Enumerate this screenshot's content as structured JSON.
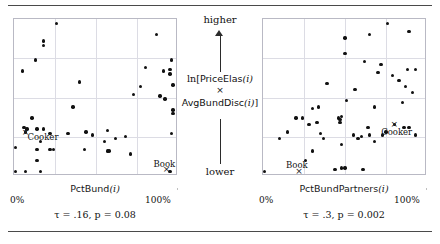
{
  "figure": {
    "y_axis": {
      "top_label": "higher",
      "bottom_label": "lower",
      "label_line1_prefix": "ln[",
      "label_line1_name": "PriceElas",
      "label_line1_arg": "(i)",
      "label_times": "×",
      "label_line2_name": "AvgBundDisc",
      "label_line2_arg": "(i)",
      "label_line2_suffix": "]",
      "label_plain": "ln[PriceElas(i) × AvgBundDisc(i)]"
    },
    "panels": [
      {
        "id": "left",
        "x_axis_name": "PctBund",
        "x_axis_arg": "(i)",
        "x_axis_label_plain": "PctBund(i)",
        "x_tick_min": "0%",
        "x_tick_max": "100%",
        "stat_text": "τ = .16, p = 0.08",
        "tau": ".16",
        "p_value": "0.08",
        "highlights": [
          {
            "label": "Cooker",
            "label_pos": "right"
          },
          {
            "label": "Book",
            "label_pos": "above"
          }
        ]
      },
      {
        "id": "right",
        "x_axis_name": "PctBundPartners",
        "x_axis_arg": "(i)",
        "x_axis_label_plain": "PctBundPartners(i)",
        "x_tick_min": "0%",
        "x_tick_max": "100%",
        "stat_text": "τ = .3, p = 0.002",
        "tau": ".3",
        "p_value": "0.002",
        "highlights": [
          {
            "label": "Cooker",
            "label_pos": "below"
          },
          {
            "label": "Book",
            "label_pos": "above"
          }
        ]
      }
    ],
    "colors": {
      "dot": "#111111",
      "grid": "#dcdce4",
      "frame": "#b9b9c4",
      "rule": "#4a4a4a",
      "text": "#111111"
    }
  },
  "chart_data": [
    {
      "type": "scatter",
      "panel": "left",
      "title": "",
      "xlabel": "PctBund(i)",
      "ylabel": "ln[PriceElas(i) × AvgBundDisc(i)]",
      "xlim": [
        0,
        100
      ],
      "ylim": [
        0,
        100
      ],
      "xtick_labels": [
        "0%",
        "100%"
      ],
      "ytick_labels": [
        "lower",
        "higher"
      ],
      "grid": true,
      "legend": "none",
      "annotations": [
        {
          "text": "Cooker",
          "x": 7,
          "y": 28,
          "marker": "x"
        },
        {
          "text": "Book",
          "x": 93,
          "y": 4,
          "marker": "x"
        }
      ],
      "stat_annotation": "τ = .16, p = 0.08",
      "points": [
        {
          "x": 26,
          "y": 97
        },
        {
          "x": 18,
          "y": 86
        },
        {
          "x": 18,
          "y": 83
        },
        {
          "x": 13,
          "y": 74
        },
        {
          "x": 5,
          "y": 67
        },
        {
          "x": 40,
          "y": 60
        },
        {
          "x": 87,
          "y": 90
        },
        {
          "x": 96,
          "y": 74
        },
        {
          "x": 80,
          "y": 69
        },
        {
          "x": 91,
          "y": 67
        },
        {
          "x": 95,
          "y": 65
        },
        {
          "x": 95,
          "y": 68
        },
        {
          "x": 77,
          "y": 57
        },
        {
          "x": 73,
          "y": 52
        },
        {
          "x": 97,
          "y": 58
        },
        {
          "x": 89,
          "y": 51
        },
        {
          "x": 92,
          "y": 49
        },
        {
          "x": 97,
          "y": 42
        },
        {
          "x": 97,
          "y": 40
        },
        {
          "x": 36,
          "y": 44
        },
        {
          "x": 11,
          "y": 37
        },
        {
          "x": 6,
          "y": 31
        },
        {
          "x": 8,
          "y": 30
        },
        {
          "x": 7,
          "y": 28
        },
        {
          "x": 14,
          "y": 30
        },
        {
          "x": 18,
          "y": 30
        },
        {
          "x": 22,
          "y": 27
        },
        {
          "x": 33,
          "y": 27
        },
        {
          "x": 44,
          "y": 28
        },
        {
          "x": 48,
          "y": 26
        },
        {
          "x": 57,
          "y": 29
        },
        {
          "x": 96,
          "y": 27
        },
        {
          "x": 16,
          "y": 22
        },
        {
          "x": 55,
          "y": 22
        },
        {
          "x": 62,
          "y": 24
        },
        {
          "x": 68,
          "y": 25
        },
        {
          "x": 1,
          "y": 18
        },
        {
          "x": 14,
          "y": 17
        },
        {
          "x": 22,
          "y": 17
        },
        {
          "x": 24,
          "y": 17
        },
        {
          "x": 43,
          "y": 17
        },
        {
          "x": 57,
          "y": 16
        },
        {
          "x": 58,
          "y": 16
        },
        {
          "x": 71,
          "y": 14
        },
        {
          "x": 14,
          "y": 10
        },
        {
          "x": 1,
          "y": 3
        },
        {
          "x": 7,
          "y": 3
        },
        {
          "x": 16,
          "y": 3
        },
        {
          "x": 95,
          "y": 3
        }
      ]
    },
    {
      "type": "scatter",
      "panel": "right",
      "title": "",
      "xlabel": "PctBundPartners(i)",
      "ylabel": "ln[PriceElas(i) × AvgBundDisc(i)]",
      "xlim": [
        0,
        100
      ],
      "ylim": [
        0,
        100
      ],
      "xtick_labels": [
        "0%",
        "100%"
      ],
      "ytick_labels": [
        "lower",
        "higher"
      ],
      "grid": true,
      "legend": "none",
      "annotations": [
        {
          "text": "Cooker",
          "x": 80,
          "y": 33,
          "marker": "x"
        },
        {
          "text": "Book",
          "x": 22,
          "y": 3,
          "marker": "x"
        }
      ],
      "stat_annotation": "τ = .3, p = 0.002",
      "points": [
        {
          "x": 76,
          "y": 97
        },
        {
          "x": 50,
          "y": 88
        },
        {
          "x": 65,
          "y": 90
        },
        {
          "x": 89,
          "y": 92
        },
        {
          "x": 50,
          "y": 78
        },
        {
          "x": 62,
          "y": 73
        },
        {
          "x": 72,
          "y": 71
        },
        {
          "x": 70,
          "y": 66
        },
        {
          "x": 88,
          "y": 68
        },
        {
          "x": 93,
          "y": 68
        },
        {
          "x": 79,
          "y": 64
        },
        {
          "x": 83,
          "y": 61
        },
        {
          "x": 87,
          "y": 57
        },
        {
          "x": 39,
          "y": 59
        },
        {
          "x": 56,
          "y": 55
        },
        {
          "x": 91,
          "y": 53
        },
        {
          "x": 51,
          "y": 48
        },
        {
          "x": 85,
          "y": 47
        },
        {
          "x": 30,
          "y": 43
        },
        {
          "x": 34,
          "y": 44
        },
        {
          "x": 68,
          "y": 44
        },
        {
          "x": 20,
          "y": 37
        },
        {
          "x": 24,
          "y": 37
        },
        {
          "x": 46,
          "y": 37
        },
        {
          "x": 47,
          "y": 36
        },
        {
          "x": 47,
          "y": 34
        },
        {
          "x": 48,
          "y": 38
        },
        {
          "x": 80,
          "y": 33
        },
        {
          "x": 64,
          "y": 31
        },
        {
          "x": 28,
          "y": 33
        },
        {
          "x": 33,
          "y": 34
        },
        {
          "x": 86,
          "y": 31
        },
        {
          "x": 89,
          "y": 31
        },
        {
          "x": 15,
          "y": 28
        },
        {
          "x": 35,
          "y": 27
        },
        {
          "x": 55,
          "y": 26
        },
        {
          "x": 60,
          "y": 25
        },
        {
          "x": 73,
          "y": 26
        },
        {
          "x": 75,
          "y": 28
        },
        {
          "x": 93,
          "y": 26
        },
        {
          "x": 10,
          "y": 24
        },
        {
          "x": 37,
          "y": 24
        },
        {
          "x": 58,
          "y": 24
        },
        {
          "x": 68,
          "y": 22
        },
        {
          "x": 48,
          "y": 20
        },
        {
          "x": 30,
          "y": 16
        },
        {
          "x": 65,
          "y": 26
        },
        {
          "x": 26,
          "y": 10
        },
        {
          "x": 1,
          "y": 3
        },
        {
          "x": 44,
          "y": 4
        },
        {
          "x": 48,
          "y": 5
        },
        {
          "x": 50,
          "y": 5
        },
        {
          "x": 61,
          "y": 4
        }
      ]
    }
  ]
}
